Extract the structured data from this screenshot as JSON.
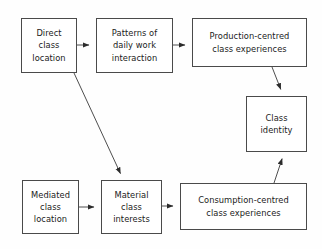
{
  "diagram": {
    "background_color": "#fefefe",
    "box_border_color": "#4a4a4a",
    "box_fill_color": "#ffffff",
    "arrow_color": "#3a3a3a",
    "text_color": "#1b1b1b",
    "nodes": [
      {
        "id": "direct-class-location",
        "label": "Direct\nclass\nlocation",
        "x": 21,
        "y": 18,
        "width": 56,
        "height": 55
      },
      {
        "id": "patterns-of-daily-work-interaction",
        "label": "Patterns of\ndaily work\ninteraction",
        "x": 96,
        "y": 18,
        "width": 77,
        "height": 55
      },
      {
        "id": "production-centred-class-experiences",
        "label": "Production-centred\nclass experiences",
        "x": 192,
        "y": 18,
        "width": 115,
        "height": 49
      },
      {
        "id": "class-identity",
        "label": "Class\nidentity",
        "x": 246,
        "y": 96,
        "width": 61,
        "height": 56
      },
      {
        "id": "mediated-class-location",
        "label": "Mediated\nclass\nlocation",
        "x": 22,
        "y": 180,
        "width": 57,
        "height": 54
      },
      {
        "id": "material-class-interests",
        "label": "Material\nclass\ninterests",
        "x": 101,
        "y": 180,
        "width": 61,
        "height": 54
      },
      {
        "id": "consumption-centred-class-experiences",
        "label": "Consumption-centred\nclass experiences",
        "x": 180,
        "y": 183,
        "width": 127,
        "height": 47
      }
    ],
    "edges": [
      {
        "id": "direct-to-patterns",
        "from": "direct-class-location",
        "to": "patterns-of-daily-work-interaction",
        "x1": 77,
        "y1": 45,
        "x2": 95,
        "y2": 45
      },
      {
        "id": "patterns-to-production",
        "from": "patterns-of-daily-work-interaction",
        "to": "production-centred-class-experiences",
        "x1": 173,
        "y1": 45,
        "x2": 191,
        "y2": 45
      },
      {
        "id": "production-to-class-identity",
        "from": "production-centred-class-experiences",
        "to": "class-identity",
        "x1": 272,
        "y1": 67,
        "x2": 283,
        "y2": 95
      },
      {
        "id": "direct-to-material",
        "from": "direct-class-location",
        "to": "material-class-interests",
        "x1": 74,
        "y1": 73,
        "x2": 123,
        "y2": 179
      },
      {
        "id": "mediated-to-material",
        "from": "mediated-class-location",
        "to": "material-class-interests",
        "x1": 79,
        "y1": 207,
        "x2": 100,
        "y2": 207
      },
      {
        "id": "material-to-consumption",
        "from": "material-class-interests",
        "to": "consumption-centred-class-experiences",
        "x1": 162,
        "y1": 206,
        "x2": 179,
        "y2": 206
      },
      {
        "id": "consumption-to-class-identity",
        "from": "consumption-centred-class-experiences",
        "to": "class-identity",
        "x1": 274,
        "y1": 183,
        "x2": 284,
        "y2": 153
      }
    ]
  }
}
